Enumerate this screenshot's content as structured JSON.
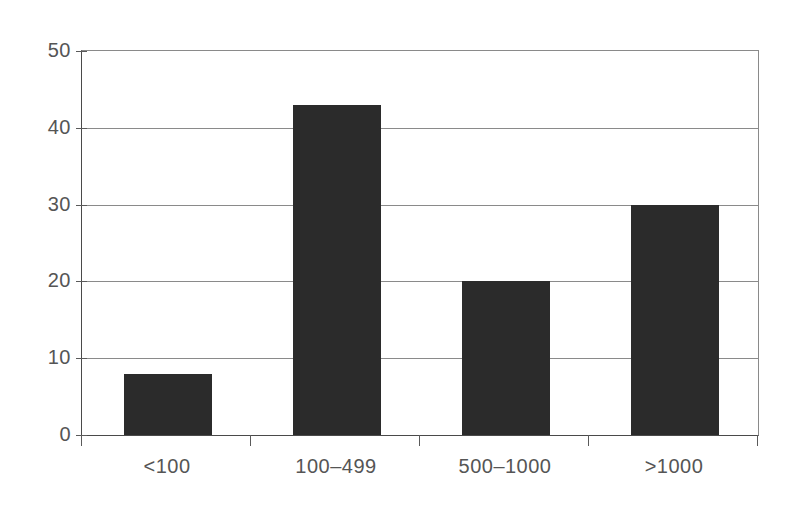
{
  "chart_data": {
    "type": "bar",
    "title": "",
    "subtitle": "",
    "xlabel": "",
    "ylabel": "",
    "categories": [
      "<100",
      "100–499",
      "500–1000",
      ">1000"
    ],
    "values": [
      8,
      43,
      20,
      30
    ],
    "series": [
      {
        "name": "",
        "values": [
          8,
          43,
          20,
          30
        ]
      }
    ],
    "ylim": [
      0,
      50
    ],
    "yticks": [
      0,
      10,
      20,
      30,
      40,
      50
    ],
    "ytick_labels": [
      "0",
      "10",
      "20",
      "30",
      "40",
      "50"
    ],
    "grid": true,
    "grid_axis": "y",
    "legend": false,
    "legend_position": "none",
    "annotations": [],
    "colors": {
      "bar_fill": "#2b2b2b",
      "gridline": "#8a8a8a",
      "axis_line": "#4a4a4a",
      "tick_mark": "#5a5a5a",
      "tick_label": "#555555",
      "background": "#ffffff"
    }
  },
  "axes": {
    "y": {
      "ticks": [
        {
          "value": 0,
          "label": "0"
        },
        {
          "value": 10,
          "label": "10"
        },
        {
          "value": 20,
          "label": "20"
        },
        {
          "value": 30,
          "label": "30"
        },
        {
          "value": 40,
          "label": "40"
        },
        {
          "value": 50,
          "label": "50"
        }
      ]
    },
    "x": {
      "ticks": [
        {
          "label": "<100"
        },
        {
          "label": "100–499"
        },
        {
          "label": "500–1000"
        },
        {
          "label": ">1000"
        }
      ]
    }
  }
}
